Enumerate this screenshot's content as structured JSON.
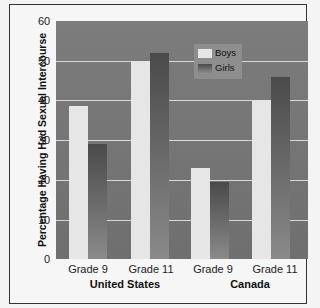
{
  "chart_data": {
    "type": "bar",
    "title": "",
    "ylabel": "Percentage Having Had Sexual Intercourse",
    "xlabel": "",
    "ylim": [
      0,
      60
    ],
    "yticks": [
      0,
      10,
      20,
      30,
      40,
      50,
      60
    ],
    "grid": true,
    "legend_position": "upper center",
    "groups": [
      "United States",
      "Canada"
    ],
    "categories": [
      "Grade 9",
      "Grade 11",
      "Grade 9",
      "Grade 11"
    ],
    "series": [
      {
        "name": "Boys",
        "color": "#e6e6e6",
        "values": [
          38.5,
          50,
          23,
          40
        ]
      },
      {
        "name": "Girls",
        "color": "#5a5a5a",
        "values": [
          29,
          52,
          19.5,
          46
        ]
      }
    ]
  },
  "axis": {
    "ylabel": "Percentage Having Had Sexual Intercourse",
    "yticks": [
      "0",
      "10",
      "20",
      "30",
      "40",
      "50",
      "60"
    ],
    "xticks": [
      "Grade 9",
      "Grade 11",
      "Grade 9",
      "Grade 11"
    ],
    "groups": [
      "United States",
      "Canada"
    ]
  },
  "legend": {
    "boys": "Boys",
    "girls": "Girls"
  }
}
